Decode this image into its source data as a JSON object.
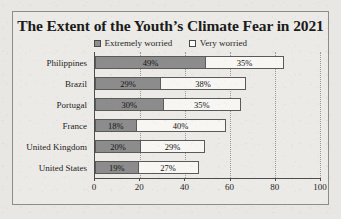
{
  "chart_data": {
    "type": "bar",
    "orientation": "horizontal",
    "stacked": true,
    "title": "The Extent of the Youth’s Climate Fear in 2021",
    "xlabel": "",
    "ylabel": "",
    "xlim": [
      0,
      100
    ],
    "xticks": [
      "0",
      "20",
      "40",
      "60",
      "80",
      "100"
    ],
    "grid": "vertical-dotted",
    "legend_position": "top-center",
    "categories": [
      "Philippines",
      "Brazil",
      "Portugal",
      "France",
      "United Kingdom",
      "United States"
    ],
    "series": [
      {
        "name": "Extremely worried",
        "color": "#8c8c8c",
        "values": [
          49,
          29,
          30,
          18,
          20,
          19
        ],
        "labels": [
          "49%",
          "29%",
          "30%",
          "18%",
          "20%",
          "19%"
        ]
      },
      {
        "name": "Very worried",
        "color": "#f7f6f3",
        "values": [
          35,
          38,
          35,
          40,
          29,
          27
        ],
        "labels": [
          "35%",
          "38%",
          "35%",
          "40%",
          "29%",
          "27%"
        ]
      }
    ]
  },
  "legend": {
    "items": [
      {
        "label": "Extremely worried",
        "swatch": "filled-square-icon"
      },
      {
        "label": "Very worried",
        "swatch": "hollow-square-icon"
      }
    ]
  },
  "colors": {
    "page_background": "#e8e7e3",
    "chart_background": "#eceae6",
    "frame_border": "#8c8c8a",
    "extremely_worried": "#8c8c8c",
    "very_worried": "#f7f6f3",
    "axis": "#4d4d4d",
    "gridline": "#9a9a9a",
    "text": "#1b1b1b"
  }
}
